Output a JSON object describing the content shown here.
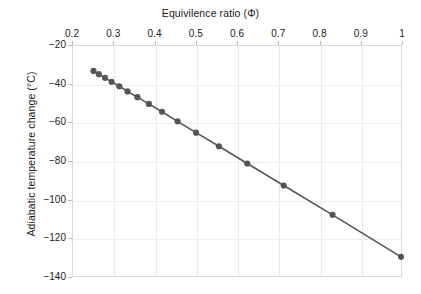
{
  "chart_data": {
    "type": "line",
    "title": "",
    "xlabel": "Equivilence ratio (Φ)",
    "ylabel": "Adiabatic temperature change (°C)",
    "xlim": [
      0.2,
      1.0
    ],
    "ylim": [
      -140,
      -20
    ],
    "xticks": [
      0.2,
      0.3,
      0.4,
      0.5,
      0.6,
      0.7,
      0.8,
      0.9,
      1
    ],
    "xtick_labels": [
      "0.2",
      "0.3",
      "0.4",
      "0.5",
      "0.6",
      "0.7",
      "0.8",
      "0.9",
      "1"
    ],
    "yticks": [
      -20,
      -40,
      -60,
      -80,
      -100,
      -120,
      -140
    ],
    "ytick_labels": [
      "−20",
      "−40",
      "−60",
      "−80",
      "−100",
      "−120",
      "−140"
    ],
    "grid": true,
    "legend": "none",
    "marker": "circle",
    "marker_color": "#555555",
    "line_color": "#555555",
    "series": [
      {
        "name": "Adiabatic temperature change",
        "x": [
          0.25,
          0.263,
          0.278,
          0.294,
          0.313,
          0.333,
          0.357,
          0.385,
          0.417,
          0.455,
          0.5,
          0.556,
          0.625,
          0.714,
          0.833,
          1.0
        ],
        "y": [
          -33.0,
          -34.7,
          -36.6,
          -38.7,
          -41.0,
          -43.7,
          -46.7,
          -50.2,
          -54.3,
          -59.3,
          -65.2,
          -72.3,
          -81.3,
          -92.8,
          -108.1,
          -130.0
        ]
      }
    ]
  }
}
